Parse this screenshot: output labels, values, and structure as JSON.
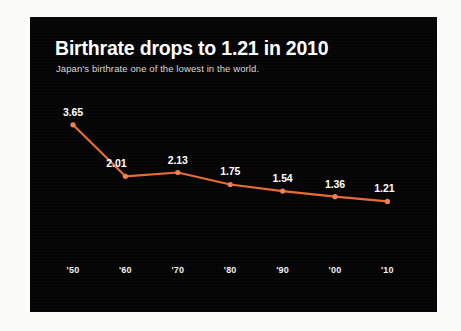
{
  "chart_data": {
    "type": "line",
    "title": "Birthrate drops to 1.21 in 2010",
    "subtitle": "Japan's birthrate one of the lowest in the world.",
    "xlabel": "",
    "ylabel": "",
    "grid": false,
    "legend": "none",
    "categories": [
      "'50",
      "'60",
      "'70",
      "'80",
      "'90",
      "'00",
      "'10"
    ],
    "x": [
      1950,
      1960,
      1970,
      1980,
      1990,
      2000,
      2010
    ],
    "values": [
      3.65,
      2.01,
      2.13,
      1.75,
      1.54,
      1.36,
      1.21
    ],
    "point_labels": [
      "3.65",
      "2.01",
      "2.13",
      "1.75",
      "1.54",
      "1.36",
      "1.21"
    ],
    "ylim": [
      1.0,
      3.9
    ],
    "series": [
      {
        "name": "Japan birthrate",
        "values": [
          3.65,
          2.01,
          2.13,
          1.75,
          1.54,
          1.36,
          1.21
        ]
      }
    ],
    "colors": {
      "line": "#e86a33",
      "marker": "#f08050",
      "background": "#040404",
      "title_text": "#ffffff",
      "subtitle_text": "#d9d9d9",
      "label_text": "#ffffff",
      "tick_text": "#f0f0f0",
      "page_background": "#fbfbfa"
    }
  }
}
